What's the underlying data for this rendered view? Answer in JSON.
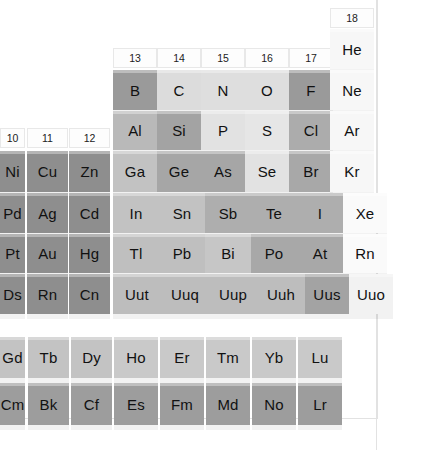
{
  "palette": {
    "background": "#ffffff",
    "frame_line": "#e2e2e2",
    "text": "#111111",
    "metal_dark": "#8f8f8f",
    "metalloid": "#b4b4b4",
    "nonmetal_light": "#d9d9d9",
    "nonmetal_pale": "#e6e6e6",
    "noble_gas": "#f4f4f4",
    "halogen": "#a5a5a5",
    "lanthanide": "#c3c3c3",
    "actinide": "#9d9d9d",
    "header_bg": "#fdfdfd",
    "header_border": "#e8e8e8"
  },
  "group_headers": [
    {
      "label": "10",
      "x": 0,
      "y": 128,
      "w": 25,
      "h": 20
    },
    {
      "label": "11",
      "x": 27,
      "y": 128,
      "w": 41,
      "h": 20
    },
    {
      "label": "12",
      "x": 69,
      "y": 128,
      "w": 41,
      "h": 20
    },
    {
      "label": "13",
      "x": 113,
      "y": 48,
      "w": 44,
      "h": 20
    },
    {
      "label": "14",
      "x": 157,
      "y": 48,
      "w": 44,
      "h": 20
    },
    {
      "label": "15",
      "x": 201,
      "y": 48,
      "w": 44,
      "h": 20
    },
    {
      "label": "16",
      "x": 245,
      "y": 48,
      "w": 44,
      "h": 20
    },
    {
      "label": "17",
      "x": 289,
      "y": 48,
      "w": 44,
      "h": 20
    },
    {
      "label": "18",
      "x": 330,
      "y": 8,
      "w": 44,
      "h": 20
    }
  ],
  "elements": [
    {
      "symbol": "He",
      "x": 330,
      "y": 29,
      "w": 44,
      "h": 40,
      "color": "#f7f7f7",
      "fs": 15
    },
    {
      "symbol": "B",
      "x": 113,
      "y": 70,
      "w": 44,
      "h": 40,
      "color": "#9a9a9a",
      "fs": 15
    },
    {
      "symbol": "C",
      "x": 157,
      "y": 70,
      "w": 44,
      "h": 40,
      "color": "#dcdcdc",
      "fs": 15
    },
    {
      "symbol": "N",
      "x": 201,
      "y": 70,
      "w": 44,
      "h": 40,
      "color": "#dedede",
      "fs": 15
    },
    {
      "symbol": "O",
      "x": 245,
      "y": 70,
      "w": 44,
      "h": 40,
      "color": "#dedede",
      "fs": 15
    },
    {
      "symbol": "F",
      "x": 289,
      "y": 70,
      "w": 44,
      "h": 40,
      "color": "#9a9a9a",
      "fs": 15
    },
    {
      "symbol": "Ne",
      "x": 330,
      "y": 70,
      "w": 44,
      "h": 40,
      "color": "#f7f7f7",
      "fs": 15
    },
    {
      "symbol": "Al",
      "x": 113,
      "y": 111,
      "w": 44,
      "h": 39,
      "color": "#b9b9b9",
      "fs": 15
    },
    {
      "symbol": "Si",
      "x": 157,
      "y": 111,
      "w": 44,
      "h": 39,
      "color": "#a3a3a3",
      "fs": 15
    },
    {
      "symbol": "P",
      "x": 201,
      "y": 111,
      "w": 44,
      "h": 39,
      "color": "#e2e2e2",
      "fs": 15
    },
    {
      "symbol": "S",
      "x": 245,
      "y": 111,
      "w": 44,
      "h": 39,
      "color": "#e6e6e6",
      "fs": 15
    },
    {
      "symbol": "Cl",
      "x": 289,
      "y": 111,
      "w": 44,
      "h": 39,
      "color": "#acacac",
      "fs": 15
    },
    {
      "symbol": "Ar",
      "x": 330,
      "y": 111,
      "w": 44,
      "h": 39,
      "color": "#f7f7f7",
      "fs": 15
    },
    {
      "symbol": "Ni",
      "x": 0,
      "y": 151,
      "w": 25,
      "h": 41,
      "color": "#8e8e8e",
      "fs": 15
    },
    {
      "symbol": "Cu",
      "x": 27,
      "y": 151,
      "w": 41,
      "h": 41,
      "color": "#8e8e8e",
      "fs": 15
    },
    {
      "symbol": "Zn",
      "x": 69,
      "y": 151,
      "w": 41,
      "h": 41,
      "color": "#8e8e8e",
      "fs": 15
    },
    {
      "symbol": "Ga",
      "x": 113,
      "y": 151,
      "w": 44,
      "h": 41,
      "color": "#c2c2c2",
      "fs": 15
    },
    {
      "symbol": "Ge",
      "x": 157,
      "y": 151,
      "w": 44,
      "h": 41,
      "color": "#a6a6a6",
      "fs": 15
    },
    {
      "symbol": "As",
      "x": 201,
      "y": 151,
      "w": 44,
      "h": 41,
      "color": "#a6a6a6",
      "fs": 15
    },
    {
      "symbol": "Se",
      "x": 245,
      "y": 151,
      "w": 44,
      "h": 41,
      "color": "#e2e2e2",
      "fs": 15
    },
    {
      "symbol": "Br",
      "x": 289,
      "y": 151,
      "w": 44,
      "h": 41,
      "color": "#a8a8a8",
      "fs": 15
    },
    {
      "symbol": "Kr",
      "x": 330,
      "y": 151,
      "w": 44,
      "h": 41,
      "color": "#f7f7f7",
      "fs": 15
    },
    {
      "symbol": "Pd",
      "x": 0,
      "y": 193,
      "w": 25,
      "h": 40,
      "color": "#8e8e8e",
      "fs": 15
    },
    {
      "symbol": "Ag",
      "x": 27,
      "y": 193,
      "w": 41,
      "h": 40,
      "color": "#8e8e8e",
      "fs": 15
    },
    {
      "symbol": "Cd",
      "x": 69,
      "y": 193,
      "w": 41,
      "h": 40,
      "color": "#8e8e8e",
      "fs": 15
    },
    {
      "symbol": "In",
      "x": 113,
      "y": 193,
      "w": 46,
      "h": 40,
      "color": "#c2c2c2",
      "fs": 15
    },
    {
      "symbol": "Sn",
      "x": 159,
      "y": 193,
      "w": 46,
      "h": 40,
      "color": "#c2c2c2",
      "fs": 15
    },
    {
      "symbol": "Sb",
      "x": 205,
      "y": 193,
      "w": 46,
      "h": 40,
      "color": "#aeaeae",
      "fs": 15
    },
    {
      "symbol": "Te",
      "x": 251,
      "y": 193,
      "w": 46,
      "h": 40,
      "color": "#aeaeae",
      "fs": 15
    },
    {
      "symbol": "I",
      "x": 297,
      "y": 193,
      "w": 46,
      "h": 40,
      "color": "#aeaeae",
      "fs": 15
    },
    {
      "symbol": "Xe",
      "x": 343,
      "y": 193,
      "w": 44,
      "h": 40,
      "color": "#fafafa",
      "fs": 15
    },
    {
      "symbol": "Pt",
      "x": 0,
      "y": 234,
      "w": 25,
      "h": 39,
      "color": "#8e8e8e",
      "fs": 15
    },
    {
      "symbol": "Au",
      "x": 27,
      "y": 234,
      "w": 41,
      "h": 39,
      "color": "#8e8e8e",
      "fs": 15
    },
    {
      "symbol": "Hg",
      "x": 69,
      "y": 234,
      "w": 41,
      "h": 39,
      "color": "#8e8e8e",
      "fs": 15
    },
    {
      "symbol": "Tl",
      "x": 113,
      "y": 234,
      "w": 46,
      "h": 39,
      "color": "#bfbfbf",
      "fs": 15
    },
    {
      "symbol": "Pb",
      "x": 159,
      "y": 234,
      "w": 46,
      "h": 39,
      "color": "#bfbfbf",
      "fs": 15
    },
    {
      "symbol": "Bi",
      "x": 205,
      "y": 234,
      "w": 46,
      "h": 39,
      "color": "#c6c6c6",
      "fs": 15
    },
    {
      "symbol": "Po",
      "x": 251,
      "y": 234,
      "w": 46,
      "h": 39,
      "color": "#a8a8a8",
      "fs": 15
    },
    {
      "symbol": "At",
      "x": 297,
      "y": 234,
      "w": 46,
      "h": 39,
      "color": "#a8a8a8",
      "fs": 15
    },
    {
      "symbol": "Rn",
      "x": 343,
      "y": 234,
      "w": 44,
      "h": 39,
      "color": "#fafafa",
      "fs": 15
    },
    {
      "symbol": "Ds",
      "x": 0,
      "y": 274,
      "w": 25,
      "h": 40,
      "color": "#8e8e8e",
      "fs": 15
    },
    {
      "symbol": "Rn",
      "x": 27,
      "y": 274,
      "w": 41,
      "h": 40,
      "color": "#8e8e8e",
      "fs": 15
    },
    {
      "symbol": "Cn",
      "x": 69,
      "y": 274,
      "w": 41,
      "h": 40,
      "color": "#8e8e8e",
      "fs": 15
    },
    {
      "symbol": "Uut",
      "x": 113,
      "y": 274,
      "w": 48,
      "h": 40,
      "color": "#bdbdbd",
      "fs": 15
    },
    {
      "symbol": "Uuq",
      "x": 161,
      "y": 274,
      "w": 48,
      "h": 40,
      "color": "#bdbdbd",
      "fs": 15
    },
    {
      "symbol": "Uup",
      "x": 209,
      "y": 274,
      "w": 48,
      "h": 40,
      "color": "#bdbdbd",
      "fs": 15
    },
    {
      "symbol": "Uuh",
      "x": 257,
      "y": 274,
      "w": 48,
      "h": 40,
      "color": "#bdbdbd",
      "fs": 15
    },
    {
      "symbol": "Uus",
      "x": 305,
      "y": 274,
      "w": 44,
      "h": 40,
      "color": "#a3a3a3",
      "fs": 15
    },
    {
      "symbol": "Uuo",
      "x": 349,
      "y": 274,
      "w": 44,
      "h": 40,
      "color": "#f2f2f2",
      "fs": 15
    },
    {
      "symbol": "Gd",
      "x": 0,
      "y": 337,
      "w": 25,
      "h": 41,
      "color": "#c3c3c3",
      "fs": 15
    },
    {
      "symbol": "Tb",
      "x": 28,
      "y": 337,
      "w": 41,
      "h": 41,
      "color": "#c3c3c3",
      "fs": 15
    },
    {
      "symbol": "Dy",
      "x": 71,
      "y": 337,
      "w": 41,
      "h": 41,
      "color": "#c3c3c3",
      "fs": 15
    },
    {
      "symbol": "Ho",
      "x": 114,
      "y": 337,
      "w": 44,
      "h": 41,
      "color": "#c9c9c9",
      "fs": 15
    },
    {
      "symbol": "Er",
      "x": 160,
      "y": 337,
      "w": 44,
      "h": 41,
      "color": "#c9c9c9",
      "fs": 15
    },
    {
      "symbol": "Tm",
      "x": 206,
      "y": 337,
      "w": 44,
      "h": 41,
      "color": "#c9c9c9",
      "fs": 15
    },
    {
      "symbol": "Yb",
      "x": 252,
      "y": 337,
      "w": 44,
      "h": 41,
      "color": "#c9c9c9",
      "fs": 15
    },
    {
      "symbol": "Lu",
      "x": 298,
      "y": 337,
      "w": 44,
      "h": 41,
      "color": "#c9c9c9",
      "fs": 15
    },
    {
      "symbol": "Cm",
      "x": 0,
      "y": 383,
      "w": 25,
      "h": 42,
      "color": "#9d9d9d",
      "fs": 15
    },
    {
      "symbol": "Bk",
      "x": 28,
      "y": 383,
      "w": 41,
      "h": 42,
      "color": "#9d9d9d",
      "fs": 15
    },
    {
      "symbol": "Cf",
      "x": 71,
      "y": 383,
      "w": 41,
      "h": 42,
      "color": "#9d9d9d",
      "fs": 15
    },
    {
      "symbol": "Es",
      "x": 114,
      "y": 383,
      "w": 44,
      "h": 42,
      "color": "#9d9d9d",
      "fs": 15
    },
    {
      "symbol": "Fm",
      "x": 160,
      "y": 383,
      "w": 44,
      "h": 42,
      "color": "#9d9d9d",
      "fs": 15
    },
    {
      "symbol": "Md",
      "x": 206,
      "y": 383,
      "w": 44,
      "h": 42,
      "color": "#9d9d9d",
      "fs": 15
    },
    {
      "symbol": "No",
      "x": 252,
      "y": 383,
      "w": 44,
      "h": 42,
      "color": "#9d9d9d",
      "fs": 15
    },
    {
      "symbol": "Lr",
      "x": 298,
      "y": 383,
      "w": 44,
      "h": 42,
      "color": "#9d9d9d",
      "fs": 15
    }
  ],
  "frame_lines": [
    {
      "x": 376,
      "y": 0,
      "w": 1,
      "h": 450
    },
    {
      "x": 0,
      "y": 418,
      "w": 378,
      "h": 1
    },
    {
      "x": 377,
      "y": 0,
      "w": 1,
      "h": 419
    }
  ]
}
